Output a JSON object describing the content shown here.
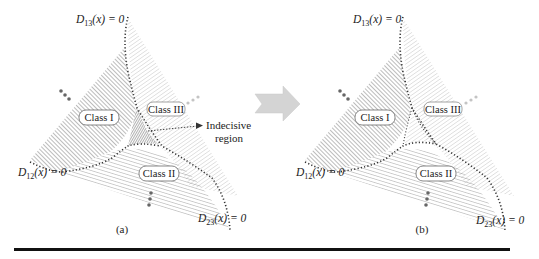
{
  "figure": {
    "panels": [
      {
        "id": "a",
        "caption": "(a)",
        "class_labels": [
          "Class I",
          "Class II",
          "Class III"
        ],
        "boundaries": {
          "d13": {
            "name": "D",
            "sub": "13",
            "rest": "(x) = 0"
          },
          "d12": {
            "name": "D",
            "sub": "12",
            "rest": "(x) = 0"
          },
          "d23": {
            "name": "D",
            "sub": "23",
            "rest": "(x) = 0"
          }
        },
        "annotation": {
          "line1": "Indecisive",
          "line2": "region"
        }
      },
      {
        "id": "b",
        "caption": "(b)",
        "class_labels": [
          "Class I",
          "Class II",
          "Class III"
        ],
        "boundaries": {
          "d13": {
            "name": "D",
            "sub": "13",
            "rest": "(x) = 0"
          },
          "d12": {
            "name": "D",
            "sub": "12",
            "rest": "(x) = 0"
          },
          "d23": {
            "name": "D",
            "sub": "23",
            "rest": "(x) = 0"
          }
        }
      }
    ],
    "colors": {
      "class1_hatch": "#6a6a6a",
      "class2_hatch": "#8a8a8a",
      "class3_hatch": "#bdbdbd",
      "indecisive_fill": "#7d7d7d",
      "boundary": "#333333",
      "arrow_fill": "#d4d4d4",
      "dots_dark": "#666666",
      "dots_light": "#c4c4c4",
      "rule": "#111111"
    }
  }
}
